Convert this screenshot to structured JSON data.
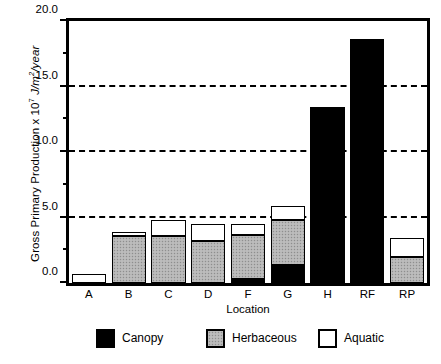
{
  "chart_data": {
    "type": "bar",
    "stacked": true,
    "title": "",
    "xlabel": "Location",
    "ylabel": "Gross Primary Production x 10^7 J/m2/year",
    "ylabel_parts": {
      "lead": "Gross Primary Production  x  10",
      "exponent": "7",
      "unit_pre": " J/m",
      "unit_sup": "2",
      "unit_post": "/year"
    },
    "categories": [
      "A",
      "B",
      "C",
      "D",
      "F",
      "G",
      "H",
      "RF",
      "RP"
    ],
    "series": [
      {
        "name": "Canopy",
        "color": "#000000",
        "values": [
          0.0,
          0.0,
          0.0,
          0.0,
          0.3,
          1.4,
          13.4,
          18.6,
          0.0
        ]
      },
      {
        "name": "Herbaceous",
        "color": "#b4b4b4",
        "values": [
          0.0,
          3.6,
          3.6,
          3.2,
          3.4,
          3.4,
          0.0,
          0.0,
          2.0
        ]
      },
      {
        "name": "Aquatic",
        "color": "#ffffff",
        "values": [
          0.7,
          0.3,
          1.2,
          1.3,
          0.8,
          1.1,
          0.0,
          0.0,
          1.4
        ]
      }
    ],
    "totals": [
      0.7,
      3.9,
      4.8,
      4.5,
      4.5,
      5.9,
      13.4,
      18.6,
      3.4
    ],
    "ylim": [
      0.0,
      20.0
    ],
    "ytick_labels": [
      "0.0",
      "5.0",
      "10.0",
      "15.0",
      "20.0"
    ],
    "ytick_values": [
      0.0,
      5.0,
      10.0,
      15.0,
      20.0
    ],
    "yminor_values": [
      2.5,
      7.5,
      12.5,
      17.5
    ],
    "gridlines_at": [
      5.0,
      10.0,
      15.0
    ],
    "grid": "horizontal-dashed",
    "legend_position": "below-plot",
    "legend": [
      {
        "label": "Canopy",
        "swatch": "canopy"
      },
      {
        "label": "Herbaceous",
        "swatch": "herbaceous"
      },
      {
        "label": "Aquatic",
        "swatch": "aquatic"
      }
    ]
  }
}
